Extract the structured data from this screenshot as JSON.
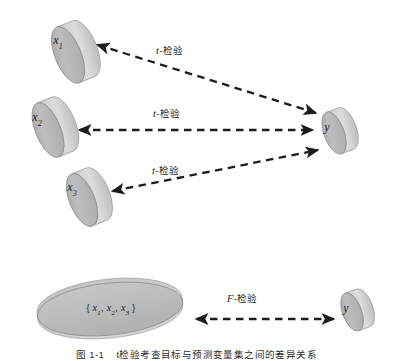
{
  "figure": {
    "caption_number": "图 1-1",
    "caption_text": "t检验考查目标与预测变量集之间的差异关系",
    "background_color": "#ffffff",
    "shape_fill": "#b9b9b9",
    "shape_top_fill": "#cfcfcf",
    "shape_side_fill": "#d8d8d8",
    "shape_stroke": "#8c8c8c",
    "arrow_color": "#1c1c1c"
  },
  "nodes": {
    "x1": {
      "label": "x",
      "subscript": "1",
      "type": "cylinder"
    },
    "x2": {
      "label": "x",
      "subscript": "2",
      "type": "cylinder"
    },
    "x3": {
      "label": "x",
      "subscript": "3",
      "type": "cylinder"
    },
    "y_top": {
      "label": "y",
      "subscript": "",
      "type": "cylinder"
    },
    "set_all": {
      "open_brace": "{",
      "close_brace": "}",
      "members": [
        {
          "label": "x",
          "subscript": "1"
        },
        {
          "label": "x",
          "subscript": "2"
        },
        {
          "label": "x",
          "subscript": "3"
        }
      ],
      "separator": ",",
      "type": "ellipse-cylinder"
    },
    "y_bottom": {
      "label": "y",
      "subscript": "",
      "type": "cylinder"
    }
  },
  "edges": [
    {
      "id": "edge-x1-y",
      "stat": "t",
      "dash": "-",
      "test": "检验",
      "from": "x1",
      "to": "y_top"
    },
    {
      "id": "edge-x2-y",
      "stat": "t",
      "dash": "-",
      "test": "检验",
      "from": "x2",
      "to": "y_top"
    },
    {
      "id": "edge-x3-y",
      "stat": "t",
      "dash": "-",
      "test": "检验",
      "from": "x3",
      "to": "y_top"
    },
    {
      "id": "edge-set-y",
      "stat": "F",
      "dash": "-",
      "test": "检验",
      "from": "set_all",
      "to": "y_bottom"
    }
  ]
}
